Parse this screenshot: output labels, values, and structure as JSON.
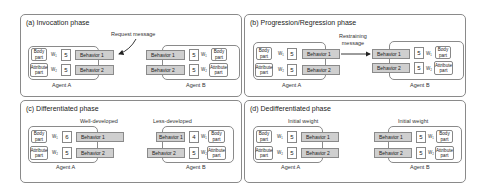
{
  "panels": [
    {
      "id": "a",
      "title": "(a) Invocation phase",
      "message": "Request message",
      "agentA": {
        "label": "Agent A",
        "body": [
          "Body",
          "part"
        ],
        "attr": [
          "Attribute",
          "part"
        ],
        "w1": "W₁",
        "w2": "W₂",
        "weight1": "5",
        "weight2": "5",
        "behavior1": "Behavior 1",
        "behavior2": "Behavior 2"
      },
      "agentB": {
        "label": "Agent B",
        "body": [
          "Body",
          "part"
        ],
        "attr": [
          "Attribute",
          "part"
        ],
        "w1": "W₁",
        "w2": "W₂",
        "weight1": "5",
        "weight2": "5",
        "behavior1": "Behavior 1",
        "behavior2": "Behavior 2"
      }
    },
    {
      "id": "b",
      "title": "(b) Progression/Regression phase",
      "message": [
        "Restraining",
        "message"
      ],
      "agentA": {
        "label": "Agent A",
        "body": [
          "Body",
          "part"
        ],
        "attr": [
          "Attribute",
          "part"
        ],
        "w1": "W₁",
        "w2": "W₂",
        "weight1": "5",
        "weight2": "5",
        "behavior1": "Behavior 1",
        "behavior2": "Behavior 2"
      },
      "agentB": {
        "label": "Agent B",
        "body": [
          "Body",
          "part"
        ],
        "attr": [
          "Attribute",
          "part"
        ],
        "w1": "W₁",
        "w2": "W₂",
        "weight1": "5",
        "weight2": "5",
        "behavior1": "Behavior 1",
        "behavior2": "Behavior 2"
      }
    },
    {
      "id": "c",
      "title": "(c) Differentiated phase",
      "noteA": "Well-developed",
      "noteB": "Less-developed",
      "agentA": {
        "label": "Agent A",
        "body": [
          "Body",
          "part"
        ],
        "attr": [
          "Attribute",
          "part"
        ],
        "w1": "W₁",
        "w2": "W₂",
        "weight1": "6",
        "weight2": "5",
        "behavior1": "Behavior 1",
        "behavior2": "Behavior 2"
      },
      "agentB": {
        "label": "Agent B",
        "body": [
          "Body",
          "part"
        ],
        "attr": [
          "Attribute",
          "part"
        ],
        "w1": "W₁",
        "w2": "W₂",
        "weight1": "4",
        "weight2": "5",
        "behavior1": "Behavior 1",
        "behavior2": "Behavior 2"
      }
    },
    {
      "id": "d",
      "title": "(d) Dedifferentiated phase",
      "noteA": "Initial weight",
      "noteB": "Initial weight",
      "agentA": {
        "label": "Agent A",
        "body": [
          "Body",
          "part"
        ],
        "attr": [
          "Attribute",
          "part"
        ],
        "w1": "W₁",
        "w2": "W₂",
        "weight1": "5",
        "weight2": "5",
        "behavior1": "Behavior 1",
        "behavior2": "Behavior 2"
      },
      "agentB": {
        "label": "Agent B",
        "body": [
          "Body",
          "part"
        ],
        "attr": [
          "Attribute",
          "part"
        ],
        "w1": "W₁",
        "w2": "W₂",
        "weight1": "5",
        "weight2": "5",
        "behavior1": "Behavior 1",
        "behavior2": "Behavior 2"
      }
    }
  ],
  "colors": {
    "behavior_fill": "#cfcfcf",
    "border": "#8a8a8a",
    "background": "#ffffff"
  }
}
